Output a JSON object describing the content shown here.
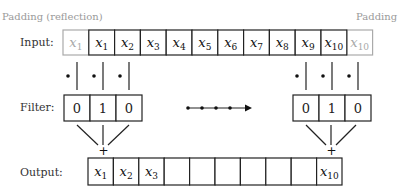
{
  "captions": {
    "left_padding": "Padding (reflection)",
    "right_padding": "Padding"
  },
  "labels": {
    "input": "Input:",
    "filter": "Filter:",
    "output": "Output:"
  },
  "input": {
    "cells": [
      {
        "base": "x",
        "sub": "1",
        "padding": true
      },
      {
        "base": "x",
        "sub": "1",
        "padding": false
      },
      {
        "base": "x",
        "sub": "2",
        "padding": false
      },
      {
        "base": "x",
        "sub": "3",
        "padding": false
      },
      {
        "base": "x",
        "sub": "4",
        "padding": false
      },
      {
        "base": "x",
        "sub": "5",
        "padding": false
      },
      {
        "base": "x",
        "sub": "6",
        "padding": false
      },
      {
        "base": "x",
        "sub": "7",
        "padding": false
      },
      {
        "base": "x",
        "sub": "8",
        "padding": false
      },
      {
        "base": "x",
        "sub": "9",
        "padding": false
      },
      {
        "base": "x",
        "sub": "10",
        "padding": false
      },
      {
        "base": "x",
        "sub": "10",
        "padding": true
      }
    ]
  },
  "filter": {
    "values": [
      "0",
      "1",
      "0"
    ],
    "operator_dot": "•",
    "sum_symbol": "+"
  },
  "output": {
    "cells": [
      {
        "base": "x",
        "sub": "1"
      },
      {
        "base": "x",
        "sub": "2"
      },
      {
        "base": "x",
        "sub": "3"
      },
      {
        "base": "",
        "sub": ""
      },
      {
        "base": "",
        "sub": ""
      },
      {
        "base": "",
        "sub": ""
      },
      {
        "base": "",
        "sub": ""
      },
      {
        "base": "",
        "sub": ""
      },
      {
        "base": "",
        "sub": ""
      },
      {
        "base": "x",
        "sub": "10"
      }
    ]
  },
  "colors": {
    "line": "#222222",
    "padding": "#aaaaaa",
    "caption": "#9a9a9a"
  }
}
